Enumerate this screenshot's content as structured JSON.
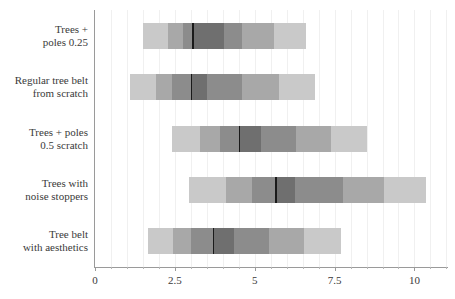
{
  "chart_data": {
    "type": "bar",
    "subtype": "horizontal-interval-gradient",
    "title": "",
    "xlabel": "",
    "ylabel": "",
    "xlim": [
      0,
      11.05
    ],
    "ylim": [
      0,
      5
    ],
    "grid": true,
    "grid_axis": "x",
    "legend": "none",
    "x_ticks": [
      0,
      2.5,
      5,
      7.5,
      10
    ],
    "x_tick_labels": [
      "0",
      "2.5",
      "5",
      "7.5",
      "10"
    ],
    "x_minor_tick_step": 0.5,
    "categories": [
      "Trees +\npoles 0.25",
      "Regular tree belt\nfrom scratch",
      "Trees + poles\n0.5 scratch",
      "Trees with\nnoise stoppers",
      "Tree belt\nwith aesthetics"
    ],
    "band_colors": [
      "#c9c9c9",
      "#a8a8a8",
      "#8c8c8c",
      "#6f6f6f",
      "#8c8c8c",
      "#a8a8a8",
      "#c9c9c9"
    ],
    "median_color": "#1a1a1a",
    "gridline_color": "#f0f0f0",
    "axis_color": "#9a9a9a",
    "text_color": "#3a3a3a",
    "background_color": "#ffffff",
    "series": [
      {
        "name": "Trees + poles 0.25",
        "median": 3.05,
        "lower": 1.5,
        "upper": 6.6,
        "band_edges": [
          1.5,
          2.3,
          2.75,
          3.05,
          4.05,
          4.6,
          5.6,
          6.6
        ]
      },
      {
        "name": "Regular tree belt from scratch",
        "median": 3.0,
        "lower": 1.1,
        "upper": 6.9,
        "band_edges": [
          1.1,
          1.9,
          2.4,
          3.0,
          3.5,
          4.6,
          5.75,
          6.9
        ]
      },
      {
        "name": "Trees + poles 0.5 scratch",
        "median": 4.5,
        "lower": 2.4,
        "upper": 8.5,
        "band_edges": [
          2.4,
          3.3,
          3.9,
          4.5,
          5.2,
          6.3,
          7.4,
          8.5
        ]
      },
      {
        "name": "Trees with noise stoppers",
        "median": 5.65,
        "lower": 2.95,
        "upper": 10.35,
        "band_edges": [
          2.95,
          4.1,
          4.9,
          5.65,
          6.25,
          7.75,
          9.05,
          10.35
        ]
      },
      {
        "name": "Tree belt with aesthetics",
        "median": 3.7,
        "lower": 1.65,
        "upper": 7.7,
        "band_edges": [
          1.65,
          2.45,
          3.0,
          3.7,
          4.35,
          5.45,
          6.55,
          7.7
        ]
      }
    ]
  }
}
